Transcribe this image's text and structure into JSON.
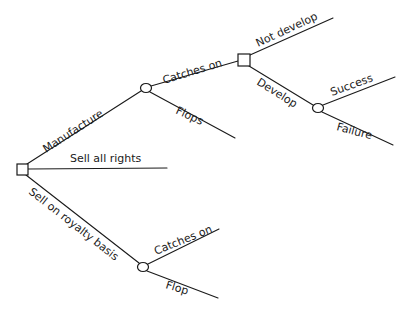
{
  "diagram": {
    "type": "decision-tree",
    "colors": {
      "line": "#1a1a1a",
      "background": "#ffffff"
    },
    "nodes": [
      {
        "id": "root",
        "kind": "decision",
        "shape": "square"
      },
      {
        "id": "manufacture-chance",
        "kind": "chance",
        "shape": "circle"
      },
      {
        "id": "develop-decision",
        "kind": "decision",
        "shape": "square"
      },
      {
        "id": "develop-chance",
        "kind": "chance",
        "shape": "circle"
      },
      {
        "id": "royalty-chance",
        "kind": "chance",
        "shape": "circle"
      }
    ],
    "edges": {
      "manufacture": "Manufacture",
      "sell_all_rights": "Sell all rights",
      "sell_royalty": "Sell on royalty basis",
      "mfg_catches_on": "Catches on",
      "mfg_flops": "Flops",
      "not_develop": "Not develop",
      "develop": "Develop",
      "success": "Success",
      "failure": "Failure",
      "roy_catches_on": "Catches on",
      "roy_flop": "Flop"
    }
  }
}
